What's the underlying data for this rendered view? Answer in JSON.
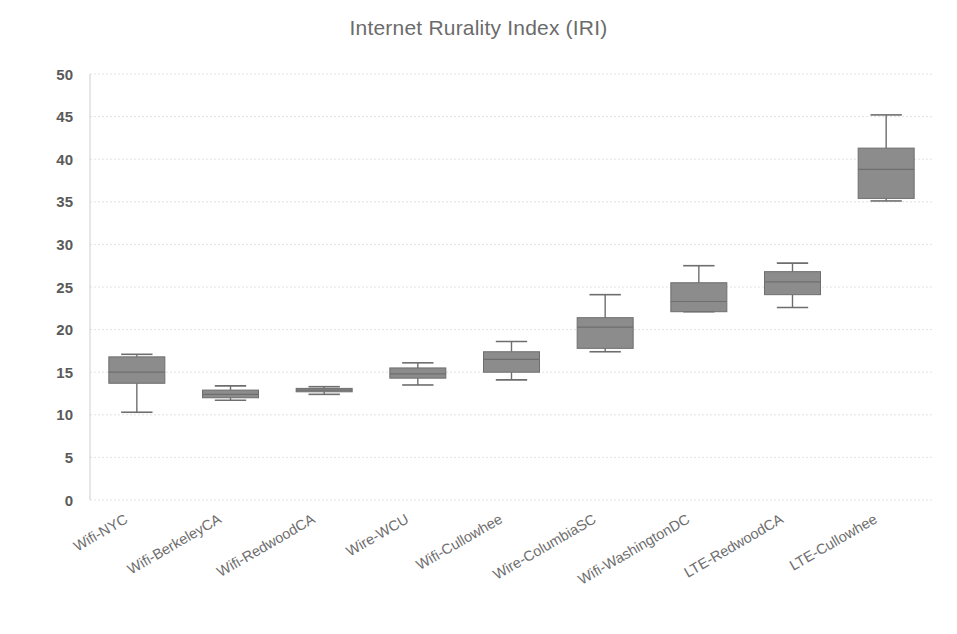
{
  "chart_data": {
    "type": "box",
    "title": "Internet Rurality Index (IRI)",
    "xlabel": "",
    "ylabel": "",
    "ylim": [
      0,
      50
    ],
    "ytick_step": 5,
    "yticks": [
      "50",
      "45",
      "40",
      "35",
      "30",
      "25",
      "20",
      "15",
      "10",
      "5",
      "0"
    ],
    "grid": true,
    "legend": "none",
    "box_color": "#8c8c8c",
    "line_color": "#6e6e6e",
    "title_color": "#6b6b6b",
    "categories": [
      "Wifi-NYC",
      "Wifi-BerkeleyCA",
      "Wifi-RedwoodCA",
      "Wire-WCU",
      "Wifi-Cullowhee",
      "Wire-ColumbiaSC",
      "Wifi-WashingtonDC",
      "LTE-RedwoodCA",
      "LTE-Cullowhee"
    ],
    "boxes": [
      {
        "category": "Wifi-NYC",
        "min": 10.3,
        "q1": 13.7,
        "median": 15.0,
        "q3": 16.8,
        "max": 17.1
      },
      {
        "category": "Wifi-BerkeleyCA",
        "min": 11.7,
        "q1": 12.0,
        "median": 12.4,
        "q3": 12.9,
        "max": 13.4
      },
      {
        "category": "Wifi-RedwoodCA",
        "min": 12.4,
        "q1": 12.7,
        "median": 12.9,
        "q3": 13.1,
        "max": 13.3
      },
      {
        "category": "Wire-WCU",
        "min": 13.5,
        "q1": 14.3,
        "median": 14.8,
        "q3": 15.5,
        "max": 16.1
      },
      {
        "category": "Wifi-Cullowhee",
        "min": 14.1,
        "q1": 15.0,
        "median": 16.5,
        "q3": 17.4,
        "max": 18.6
      },
      {
        "category": "Wire-ColumbiaSC",
        "min": 17.4,
        "q1": 17.8,
        "median": 20.3,
        "q3": 21.4,
        "max": 24.1
      },
      {
        "category": "Wifi-WashingtonDC",
        "min": 22.1,
        "q1": 22.1,
        "median": 23.3,
        "q3": 25.5,
        "max": 27.5
      },
      {
        "category": "LTE-RedwoodCA",
        "min": 22.6,
        "q1": 24.1,
        "median": 25.6,
        "q3": 26.8,
        "max": 27.8
      },
      {
        "category": "LTE-Cullowhee",
        "min": 35.1,
        "q1": 35.4,
        "median": 38.8,
        "q3": 41.3,
        "max": 45.2
      }
    ]
  }
}
